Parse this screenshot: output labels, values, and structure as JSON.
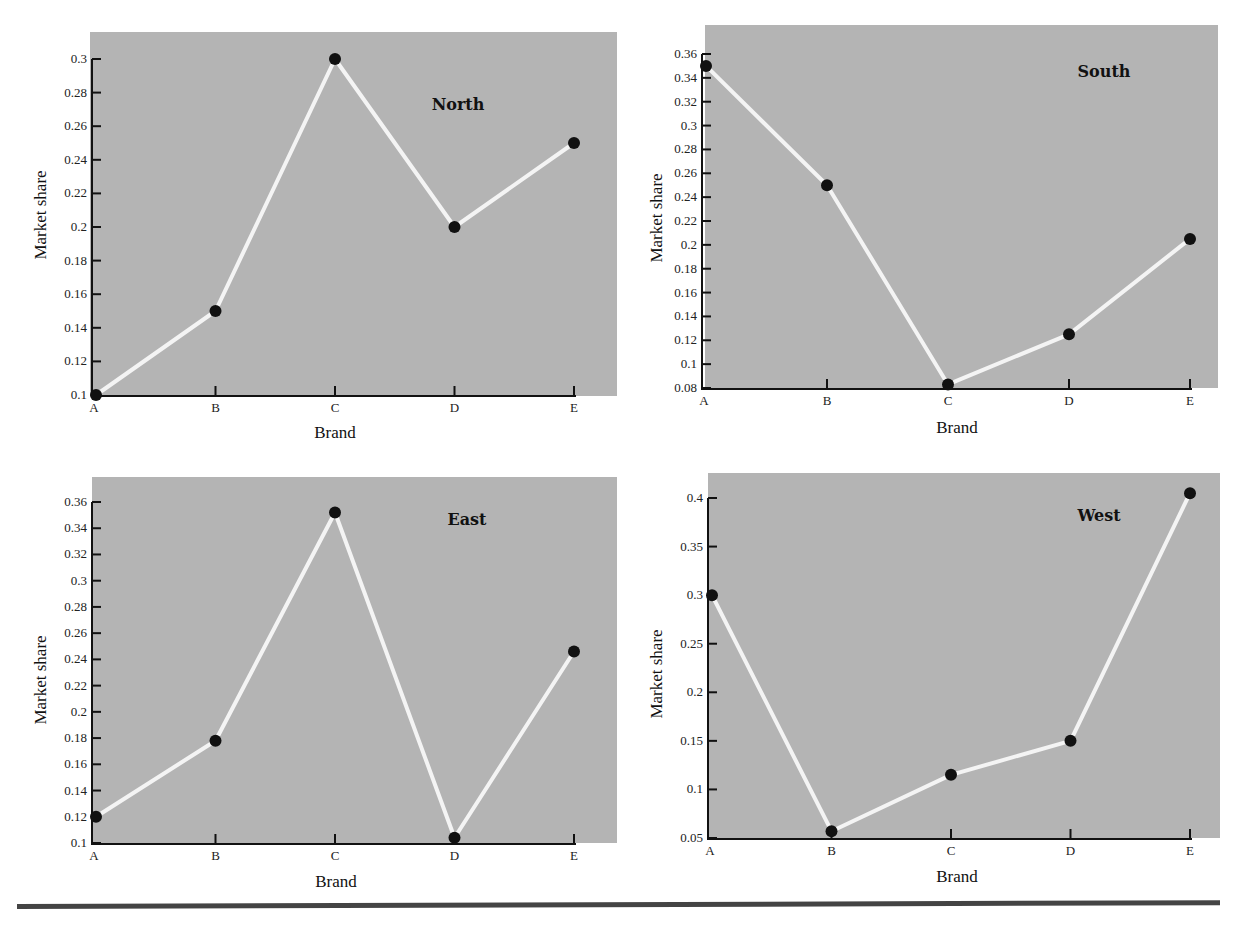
{
  "figure": {
    "background": "#ffffff",
    "plot_background": "#b4b4b4",
    "line_color": "#f4f4f4",
    "marker_color": "#111111",
    "axis_color": "#111111"
  },
  "chart_data": [
    {
      "type": "line",
      "title": "North",
      "xlabel": "Brand",
      "ylabel": "Market share",
      "categories": [
        "A",
        "B",
        "C",
        "D",
        "E"
      ],
      "values": [
        0.1,
        0.15,
        0.3,
        0.2,
        0.25
      ],
      "ylim": [
        0.1,
        0.3
      ],
      "yticks": [
        "0.1",
        "0.12",
        "0.14",
        "0.16",
        "0.18",
        "0.2",
        "0.22",
        "0.24",
        "0.26",
        "0.28",
        "0.3"
      ],
      "grid": false,
      "legend": null
    },
    {
      "type": "line",
      "title": "South",
      "xlabel": "Brand",
      "ylabel": "Market share",
      "categories": [
        "A",
        "B",
        "C",
        "D",
        "E"
      ],
      "values": [
        0.35,
        0.25,
        0.083,
        0.125,
        0.205
      ],
      "ylim": [
        0.08,
        0.36
      ],
      "yticks": [
        "0.08",
        "0.1",
        "0.12",
        "0.14",
        "0.16",
        "0.18",
        "0.2",
        "0.22",
        "0.24",
        "0.26",
        "0.28",
        "0.3",
        "0.32",
        "0.34",
        "0.36"
      ],
      "grid": false,
      "legend": null
    },
    {
      "type": "line",
      "title": "East",
      "xlabel": "Brand",
      "ylabel": "Market share",
      "categories": [
        "A",
        "B",
        "C",
        "D",
        "E"
      ],
      "values": [
        0.12,
        0.178,
        0.352,
        0.104,
        0.246
      ],
      "ylim": [
        0.1,
        0.36
      ],
      "yticks": [
        "0.1",
        "0.12",
        "0.14",
        "0.16",
        "0.18",
        "0.2",
        "0.22",
        "0.24",
        "0.26",
        "0.28",
        "0.3",
        "0.32",
        "0.34",
        "0.36"
      ],
      "grid": false,
      "legend": null
    },
    {
      "type": "line",
      "title": "West",
      "xlabel": "Brand",
      "ylabel": "Market share",
      "categories": [
        "A",
        "B",
        "C",
        "D",
        "E"
      ],
      "values": [
        0.3,
        0.057,
        0.115,
        0.15,
        0.405
      ],
      "ylim": [
        0.05,
        0.4
      ],
      "yticks": [
        "0.05",
        "0.1",
        "0.15",
        "0.2",
        "0.25",
        "0.3",
        "0.35",
        "0.4"
      ],
      "grid": false,
      "legend": null
    }
  ]
}
